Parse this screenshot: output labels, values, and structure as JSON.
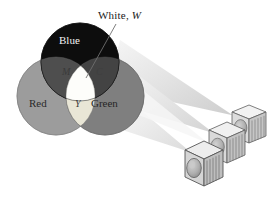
{
  "figure": {
    "background_color": "#ffffff"
  },
  "labels": {
    "white_prefix": "White, ",
    "white_symbol": "W",
    "blue": "Blue",
    "red": "Red",
    "green": "Green",
    "magenta_symbol": "M",
    "cyan_symbol": "C",
    "yellow_symbol": "Y"
  },
  "circles": [
    {
      "name": "blue",
      "label": "Blue",
      "cx": 80,
      "cy": 62,
      "r": 39,
      "fill": "#0d0d0d",
      "stroke": "#000000"
    },
    {
      "name": "red",
      "label": "Red",
      "cx": 56,
      "cy": 96,
      "r": 39,
      "fill": "#9c9c9c",
      "stroke": "#7d7d7d"
    },
    {
      "name": "green",
      "label": "Green",
      "cx": 105,
      "cy": 96,
      "r": 39,
      "fill": "#7f7f7f",
      "stroke": "#6a6a6a"
    }
  ],
  "overlaps": [
    {
      "name": "magenta",
      "symbol": "M",
      "fill": "#4c4c4c",
      "between": [
        "blue",
        "red"
      ]
    },
    {
      "name": "cyan",
      "symbol": "C",
      "fill": "#434343",
      "between": [
        "blue",
        "green"
      ]
    },
    {
      "name": "yellow",
      "symbol": "Y",
      "fill": "#e8e5d4",
      "between": [
        "red",
        "green"
      ]
    },
    {
      "name": "white",
      "symbol": "W",
      "fill": "#fdfdfb",
      "between": [
        "blue",
        "red",
        "green"
      ]
    }
  ],
  "leader_line": {
    "name": "white-leader-line",
    "from_x": 116,
    "from_y": 24,
    "to_x": 86,
    "to_y": 76,
    "color": "#6e6e6e"
  },
  "beams": {
    "count": 3,
    "fill_light": "#f1f1f1",
    "fill_mid": "#e6e6e6",
    "fill_dark": "#dcdcdc"
  },
  "projectors": [
    {
      "name": "projector-front",
      "order": 1,
      "x": 186,
      "y": 148,
      "size": 30,
      "face_fill": "#d8d8d8",
      "top_fill": "#f0f0f0",
      "side_fill": "#c2c2c2",
      "lens_fill": "#aeaeae",
      "stroke": "#5a5a5a",
      "vents": 6
    },
    {
      "name": "projector-middle",
      "order": 2,
      "x": 210,
      "y": 129,
      "size": 28,
      "face_fill": "#dcdcdc",
      "top_fill": "#f2f2f2",
      "side_fill": "#c6c6c6",
      "lens_fill": "#b4b4b4",
      "stroke": "#5e5e5e",
      "vents": 6
    },
    {
      "name": "projector-back",
      "order": 3,
      "x": 232,
      "y": 112,
      "size": 27,
      "face_fill": "#e0e0e0",
      "top_fill": "#f4f4f4",
      "side_fill": "#cacaca",
      "lens_fill": "#bcbcbc",
      "stroke": "#626262",
      "vents": 6
    }
  ]
}
